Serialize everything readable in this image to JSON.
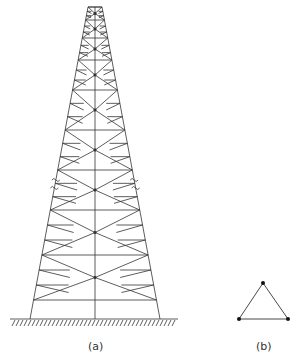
{
  "figure": {
    "panel_a": {
      "label": "(a)",
      "description": "Lattice transmission tower with cross bracing, broken-length marks, fixed ground base"
    },
    "panel_b": {
      "label": "(b)",
      "description": "Triangular cross-section of tower with three corner nodes"
    }
  },
  "colors": {
    "line": "#333333",
    "background": "#ffffff"
  }
}
